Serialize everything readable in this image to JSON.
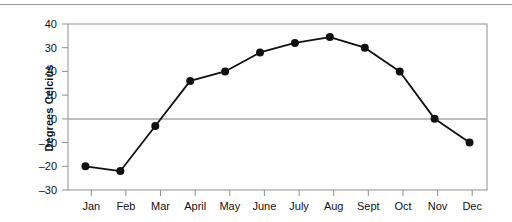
{
  "chart_data": {
    "type": "line",
    "title": "",
    "subtitle": "",
    "xlabel": "",
    "ylabel": "Degrees Celcius",
    "categories": [
      "Jan",
      "Feb",
      "Mar",
      "April",
      "May",
      "June",
      "July",
      "Aug",
      "Sept",
      "Oct",
      "Nov",
      "Dec"
    ],
    "values": [
      -20,
      -22,
      -3,
      16,
      20,
      28,
      32,
      34.5,
      30,
      20,
      0,
      -10
    ],
    "series": [
      {
        "name": "Temperature",
        "values": [
          -20,
          -22,
          -3,
          16,
          20,
          28,
          32,
          34.5,
          30,
          20,
          0,
          -10
        ]
      }
    ],
    "ylim": [
      -30,
      40
    ],
    "y_ticks": [
      40,
      30,
      20,
      10,
      0,
      -10,
      -20,
      -30
    ],
    "y_tick_labels": [
      "40",
      "30",
      "20",
      "10",
      "0",
      "–10",
      "–20",
      "–30"
    ],
    "x_ticks": [
      "Jan",
      "Feb",
      "Mar",
      "April",
      "May",
      "June",
      "July",
      "Aug",
      "Sept",
      "Oct",
      "Nov",
      "Dec"
    ],
    "grid": false,
    "zero_line": true,
    "legend": false,
    "legend_position": "none",
    "annotations": [],
    "colors": {
      "line": "#111111",
      "marker": "#111111",
      "axis": "#888888",
      "zero_line": "#b5b5b5",
      "text": "#111111",
      "top_rule": "#9a9a9a",
      "background": "#ffffff"
    }
  },
  "axis": {
    "y_title": "Degrees Celcius",
    "y_labels": [
      "40",
      "30",
      "20",
      "10",
      "0",
      "–10",
      "–20",
      "–30"
    ],
    "x_labels": [
      "Jan",
      "Feb",
      "Mar",
      "April",
      "May",
      "June",
      "July",
      "Aug",
      "Sept",
      "Oct",
      "Nov",
      "Dec"
    ]
  }
}
